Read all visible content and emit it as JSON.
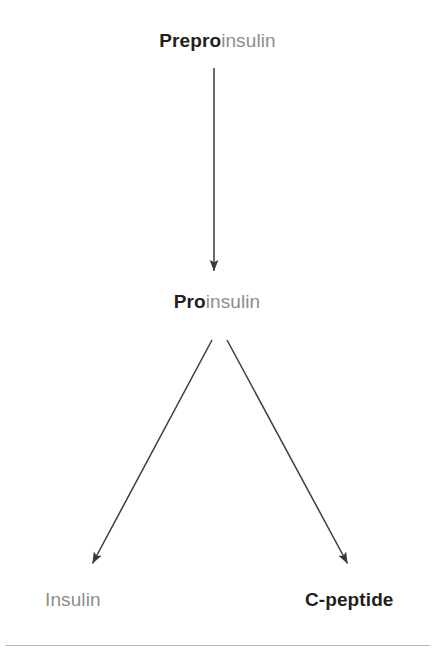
{
  "figure": {
    "type": "flow-diagram",
    "background_color": "#ffffff",
    "accent_dark": "#231f20",
    "accent_light": "#8d8d8d",
    "rule_color": "#b9b9bb",
    "arrow_color": "#3b3b3d"
  },
  "nodes": {
    "preproinsulin": {
      "full_text": "Preproinsulin",
      "emphasis_prefix": "Prepro",
      "remainder": "insulin"
    },
    "proinsulin": {
      "full_text": "Proinsulin",
      "emphasis_prefix": "Pro",
      "remainder": "insulin"
    },
    "insulin": {
      "full_text": "Insulin"
    },
    "cpeptide": {
      "full_text": "C-peptide"
    }
  },
  "edges": [
    {
      "name": "preproinsulin-to-proinsulin",
      "from": "preproinsulin",
      "to": "proinsulin",
      "direction": "down"
    },
    {
      "name": "proinsulin-to-insulin",
      "from": "proinsulin",
      "to": "insulin",
      "direction": "down-left"
    },
    {
      "name": "proinsulin-to-cpeptide",
      "from": "proinsulin",
      "to": "cpeptide",
      "direction": "down-right"
    }
  ]
}
